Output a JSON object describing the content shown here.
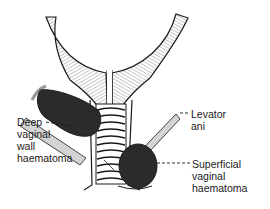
{
  "figure": {
    "type": "anatomical-illustration",
    "labels": {
      "deep": {
        "line1": "Deep",
        "line2": "vaginal",
        "line3": "wall",
        "line4": "haematoma"
      },
      "levator": {
        "line1": "Levator",
        "line2": "ani"
      },
      "superficial": {
        "line1": "Superficial",
        "line2": "vaginal",
        "line3": "haematoma"
      }
    },
    "colors": {
      "ink": "#1a1a1a",
      "haematoma": "#2b2b2b",
      "muscle_fill": "#d9d9d9",
      "background": "#ffffff"
    }
  }
}
